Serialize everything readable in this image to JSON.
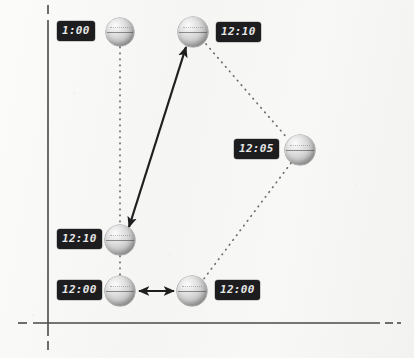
{
  "figure": {
    "kind": "spacetime-clock-diagram",
    "width": 414,
    "height": 358,
    "background_color": "#f7f7f5",
    "axis_color": "#4a4a4a",
    "badge_background": "#1d1d1f",
    "badge_text_color": "#e8e8e8",
    "connector_color": "#6b6b6b",
    "arrow_color": "#1f1f1f"
  },
  "axes": {
    "vertical": {
      "x": 48,
      "y_top": 5,
      "y_bottom": 350,
      "dashed_tips": true
    },
    "horizontal": {
      "y": 323,
      "x_left": 18,
      "x_right": 401,
      "dashed_tips": true
    }
  },
  "clocks": [
    {
      "id": "clock-top-left",
      "label": "1:00",
      "cx": 120,
      "cy": 32,
      "r": 14,
      "label_x": 57,
      "label_y": 21
    },
    {
      "id": "clock-top-middle",
      "label": "12:10",
      "cx": 193,
      "cy": 32,
      "r": 15,
      "label_x": 216,
      "label_y": 22
    },
    {
      "id": "clock-right",
      "label": "12:05",
      "cx": 300,
      "cy": 150,
      "r": 15,
      "label_x": 234,
      "label_y": 139
    },
    {
      "id": "clock-mid-left",
      "label": "12:10",
      "cx": 120,
      "cy": 240,
      "r": 15,
      "label_x": 57,
      "label_y": 229
    },
    {
      "id": "clock-bottom-left",
      "label": "12:00",
      "cx": 120,
      "cy": 291,
      "r": 15,
      "label_x": 57,
      "label_y": 280
    },
    {
      "id": "clock-bottom-right",
      "label": "12:00",
      "cx": 192,
      "cy": 291,
      "r": 15,
      "label_x": 215,
      "label_y": 280
    }
  ],
  "connectors": [
    {
      "id": "dotted-left-column-upper",
      "style": "dotted",
      "from": [
        120,
        47
      ],
      "to": [
        120,
        225
      ]
    },
    {
      "id": "dotted-left-column-lower",
      "style": "dotted",
      "from": [
        120,
        255
      ],
      "to": [
        120,
        276
      ]
    },
    {
      "id": "dotted-top-to-right",
      "style": "dotted",
      "from": [
        205,
        44
      ],
      "to": [
        288,
        139
      ]
    },
    {
      "id": "dotted-right-to-bottom",
      "style": "dotted",
      "from": [
        291,
        163
      ],
      "to": [
        203,
        280
      ]
    }
  ],
  "arrows": [
    {
      "id": "arrow-diagonal",
      "style": "solid",
      "double_headed": true,
      "from": [
        128,
        228
      ],
      "to": [
        186,
        46
      ]
    },
    {
      "id": "arrow-horizontal",
      "style": "solid",
      "double_headed": true,
      "from": [
        138,
        291
      ],
      "to": [
        175,
        291
      ]
    }
  ]
}
